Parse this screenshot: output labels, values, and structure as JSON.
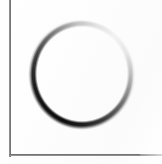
{
  "document": {
    "title": "Scanned page fragment with hand-drawn circle",
    "media": "scanned-paper",
    "background_color": "#ffffff",
    "paper_tone": "#fdfdfd",
    "width_px": 162,
    "height_px": 164
  },
  "frame": {
    "name": "page-border-frame",
    "left_rule": {
      "label": "left vertical page border",
      "color": "#5e5e5e",
      "x_px": 9,
      "top_px": 0,
      "length_px": 157,
      "thickness_px": 2,
      "orientation": "vertical"
    },
    "bottom_rule": {
      "label": "bottom horizontal page border",
      "color": "#5a5a5a",
      "y_px": 154,
      "left_px": 9,
      "length_px": 153,
      "thickness_px": 2,
      "orientation": "horizontal"
    },
    "bottom_rule_tail": {
      "label": "faded bottom border continuation",
      "color": "#9b9b9b",
      "y_px": 154,
      "left_px": 140,
      "length_px": 22
    },
    "top_edge": "cropped / not visible",
    "right_edge": "cropped / not visible"
  },
  "mark": {
    "name": "hand-drawn-circle",
    "shape": "circle-outline",
    "fill": "none",
    "interior_color": "#ffffff",
    "center_px": {
      "x": 82,
      "y": 74
    },
    "radius_px": {
      "x": 52,
      "y": 54
    },
    "bounds_px": {
      "left": 30,
      "top": 20,
      "right": 134,
      "bottom": 128
    },
    "stroke": {
      "style": "soft-brush gradient",
      "darkest_color": "#0d0d0d",
      "lightest_color": "#f2f2f2",
      "darkest_sector": "upper-left to left",
      "lightest_sector": "lower-right to right",
      "max_width_px": 5,
      "min_width_px": 1,
      "blur": "soft / anti-aliased"
    }
  },
  "labels": {
    "alt_text": "A soft-edged hand-drawn circle outline on white paper, dark along the upper-left arc and fading to near-white on the lower-right arc, with a page border rule along the left and bottom edges."
  }
}
